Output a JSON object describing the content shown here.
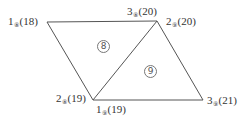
{
  "diagram": {
    "type": "finite-element-mesh",
    "line_color": "#555555",
    "vertices": [
      {
        "id": "TL",
        "x": 47,
        "y": 22
      },
      {
        "id": "TR",
        "x": 157,
        "y": 21
      },
      {
        "id": "BL",
        "x": 93,
        "y": 100
      },
      {
        "id": "BR",
        "x": 203,
        "y": 100
      }
    ],
    "edges": [
      [
        "TL",
        "TR"
      ],
      [
        "TL",
        "BL"
      ],
      [
        "TR",
        "BL"
      ],
      [
        "TR",
        "BR"
      ],
      [
        "BL",
        "BR"
      ]
    ],
    "elements": [
      {
        "number": "8",
        "symbol": "⑧",
        "nodes": [
          "TL",
          "TR",
          "BL"
        ]
      },
      {
        "number": "9",
        "symbol": "⑨",
        "nodes": [
          "TR",
          "BR",
          "BL"
        ]
      }
    ],
    "node_labels": [
      {
        "vertex": "TL",
        "local": "1",
        "element": "⑧",
        "global": "(18)"
      },
      {
        "vertex": "TR",
        "local": "3",
        "element": "⑧",
        "global": "(20)"
      },
      {
        "vertex": "TR",
        "local": "2",
        "element": "⑨",
        "global": "(20)"
      },
      {
        "vertex": "BL",
        "local": "2",
        "element": "⑧",
        "global": "(19)"
      },
      {
        "vertex": "BL",
        "local": "1",
        "element": "⑨",
        "global": "(19)"
      },
      {
        "vertex": "BR",
        "local": "3",
        "element": "⑨",
        "global": "(21)"
      }
    ]
  }
}
